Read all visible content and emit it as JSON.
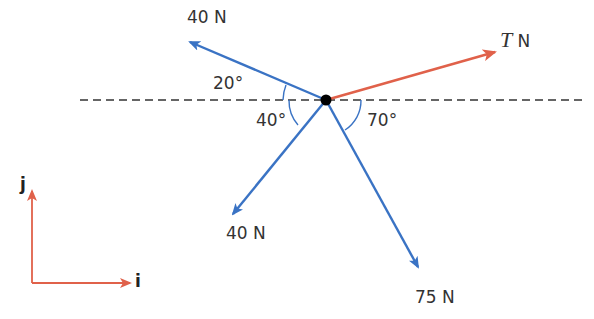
{
  "diagram": {
    "type": "force-diagram",
    "colors": {
      "force_blue": "#3a73c4",
      "tension_red": "#e0614a",
      "reference_line": "#333333",
      "particle": "#000000",
      "axes_red": "#e0614a"
    },
    "forces": [
      {
        "id": "force-40n-upper-left",
        "label": "40 N",
        "magnitude": 40,
        "angle_label": "20°",
        "direction": "20° above horizontal, pointing left"
      },
      {
        "id": "force-t-upper-right",
        "label_var": "T",
        "label_unit": "N",
        "direction": "up and to the right (unknown angle)"
      },
      {
        "id": "force-40n-lower-left",
        "label": "40 N",
        "magnitude": 40,
        "angle_label": "40°",
        "direction": "40° below horizontal, pointing left"
      },
      {
        "id": "force-75n-lower-right",
        "label": "75 N",
        "magnitude": 75,
        "angle_label": "70°",
        "direction": "70° below horizontal, pointing right"
      }
    ],
    "angles": {
      "upper_left": "20°",
      "lower_left": "40°",
      "lower_right": "70°"
    },
    "unit_vectors": {
      "i": "i",
      "j": "j"
    }
  }
}
